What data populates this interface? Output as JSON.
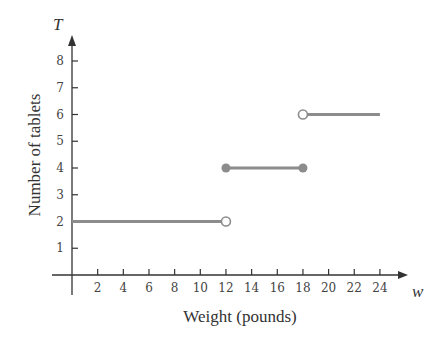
{
  "chart_data": {
    "type": "line",
    "subtype": "step-function",
    "title": "",
    "xlabel": "Weight (pounds)",
    "ylabel": "Number of tablets",
    "x_var": "w",
    "y_var": "T",
    "xlim": [
      0,
      25
    ],
    "ylim": [
      0,
      9
    ],
    "x_ticks": [
      2,
      4,
      6,
      8,
      10,
      12,
      14,
      16,
      18,
      20,
      22,
      24
    ],
    "y_ticks": [
      1,
      2,
      3,
      4,
      5,
      6,
      7,
      8
    ],
    "grid": false,
    "legend": null,
    "segments": [
      {
        "x_start": 0,
        "x_end": 12,
        "y": 2,
        "start_closed": true,
        "end_closed": false
      },
      {
        "x_start": 12,
        "x_end": 18,
        "y": 4,
        "start_closed": true,
        "end_closed": true
      },
      {
        "x_start": 18,
        "x_end": 24,
        "y": 6,
        "start_closed": false,
        "end_closed": null
      }
    ],
    "line_color": "#8c8c8c"
  },
  "labels": {
    "xlabel": "Weight (pounds)",
    "ylabel": "Number of tablets",
    "x_var": "w",
    "y_var": "T"
  }
}
